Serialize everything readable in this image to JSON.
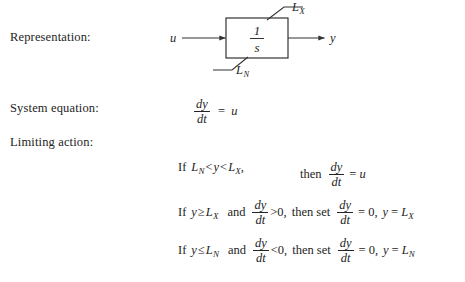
{
  "labels": {
    "representation": "Representation:",
    "system_equation": "System equation:",
    "limiting_action": "Limiting action:"
  },
  "diagram": {
    "block_numerator": "1",
    "block_denominator": "s",
    "input_label": "u",
    "output_label": "y",
    "upper_limit_label": "L",
    "upper_limit_subscript": "X",
    "lower_limit_label": "L",
    "lower_limit_subscript": "N",
    "line_color": "#333333",
    "box_fill": "#ffffff"
  },
  "system_equation": {
    "numerator": "dy",
    "denominator": "dt",
    "equals": "=",
    "rhs": "u"
  },
  "limiting_action": {
    "rows": [
      {
        "if_word": "If",
        "lhs_var": "L",
        "lhs_sub": "N",
        "rel1": "<",
        "mid_var": "y",
        "rel2": "<",
        "rhs_var": "L",
        "rhs_sub": "X",
        "comma": ",",
        "then_word": "then",
        "frac_num": "dy",
        "frac_den": "dt",
        "equals": "=",
        "result": "u"
      },
      {
        "if_word": "If",
        "var": "y",
        "rel": "≥",
        "limit_var": "L",
        "limit_sub": "X",
        "and_word": "and",
        "frac_num": "dy",
        "frac_den": "dt",
        "deriv_rel": ">0,",
        "then_word": "then set",
        "set_num": "dy",
        "set_den": "dt",
        "equals1": "=",
        "zero": "0,",
        "assign_var": "y",
        "equals2": "=",
        "assign_limit": "L",
        "assign_sub": "X"
      },
      {
        "if_word": "If",
        "var": "y",
        "rel": "≤",
        "limit_var": "L",
        "limit_sub": "N",
        "and_word": "and",
        "frac_num": "dy",
        "frac_den": "dt",
        "deriv_rel": "<0,",
        "then_word": "then set",
        "set_num": "dy",
        "set_den": "dt",
        "equals1": "=",
        "zero": "0,",
        "assign_var": "y",
        "equals2": "=",
        "assign_limit": "L",
        "assign_sub": "N"
      }
    ]
  }
}
